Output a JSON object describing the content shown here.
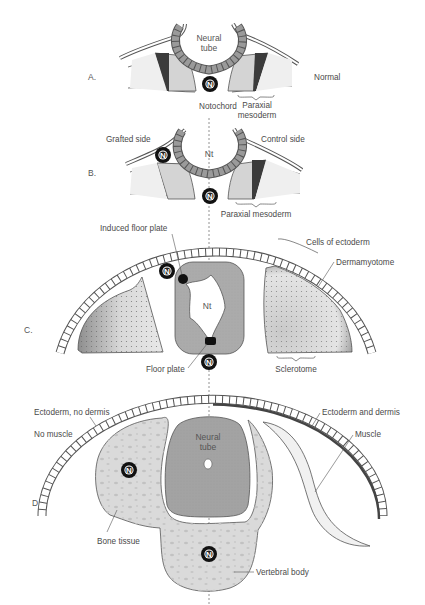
{
  "figure": {
    "panels": [
      "A.",
      "B.",
      "C.",
      "D."
    ],
    "panel_a": {
      "neural_tube_line1": "Neural",
      "neural_tube_line2": "tube",
      "notochord": "Notochord",
      "paraxial_line1": "Paraxial",
      "paraxial_line2": "mesoderm",
      "condition": "Normal"
    },
    "panel_b": {
      "grafted_side": "Grafted side",
      "control_side": "Control side",
      "nt": "Nt",
      "paraxial": "Paraxial mesoderm"
    },
    "panel_c": {
      "induced_floor_plate": "Induced floor plate",
      "cells_of_ectoderm": "Cells of ectoderm",
      "dermamyotome": "Dermamyotome",
      "nt": "Nt",
      "floor_plate": "Floor plate",
      "sclerotome": "Sclerotome"
    },
    "panel_d": {
      "ectoderm_no_dermis": "Ectoderm, no dermis",
      "no_muscle": "No muscle",
      "ectoderm_and_dermis": "Ectoderm and dermis",
      "muscle": "Muscle",
      "neural_tube_line1": "Neural",
      "neural_tube_line2": "tube",
      "bone_tissue": "Bone tissue",
      "vertebral_body": "Vertebral body"
    },
    "notochord_symbol": "N",
    "colors": {
      "tissue_light": "#d9d9d9",
      "tissue_mid": "#b4b4b4",
      "neural_tube": "#9e9e9e",
      "dark": "#1a1a1a",
      "outline": "#555555"
    }
  }
}
